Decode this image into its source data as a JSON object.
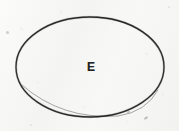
{
  "figure": {
    "kind": "hand-drawn-ellipse-diagram",
    "medium_note": "photocopied paper scan",
    "background_color": "#f7f7f6",
    "ink_color": "#2b2b2b",
    "canvas": {
      "width": 179,
      "height": 131
    },
    "shapes": [
      {
        "id": "ellipse-outline",
        "type": "ellipse",
        "label": "E",
        "center_x": 90,
        "center_y": 67,
        "radius_x": 74,
        "radius_y": 50,
        "stroke_color": "#2b2b2b",
        "stroke_width": 1.3,
        "fill": "none"
      }
    ],
    "labels": [
      {
        "id": "ellipse-center-label",
        "text": "E",
        "x": 91,
        "y": 67,
        "font_size": 12,
        "weight": "bold",
        "color": "#242424"
      }
    ],
    "artifacts": [
      {
        "id": "speck-left",
        "x": 7,
        "y": 32,
        "opacity": 0.45
      },
      {
        "id": "speck-br",
        "x": 128,
        "y": 112,
        "opacity": 0.55
      },
      {
        "id": "speck-edge",
        "x": 146,
        "y": 118,
        "opacity": 0.6
      },
      {
        "id": "speck-top",
        "x": 169,
        "y": 7,
        "opacity": 0.22
      },
      {
        "id": "speck-bottom",
        "x": 31,
        "y": 125,
        "opacity": 0.2
      }
    ]
  }
}
